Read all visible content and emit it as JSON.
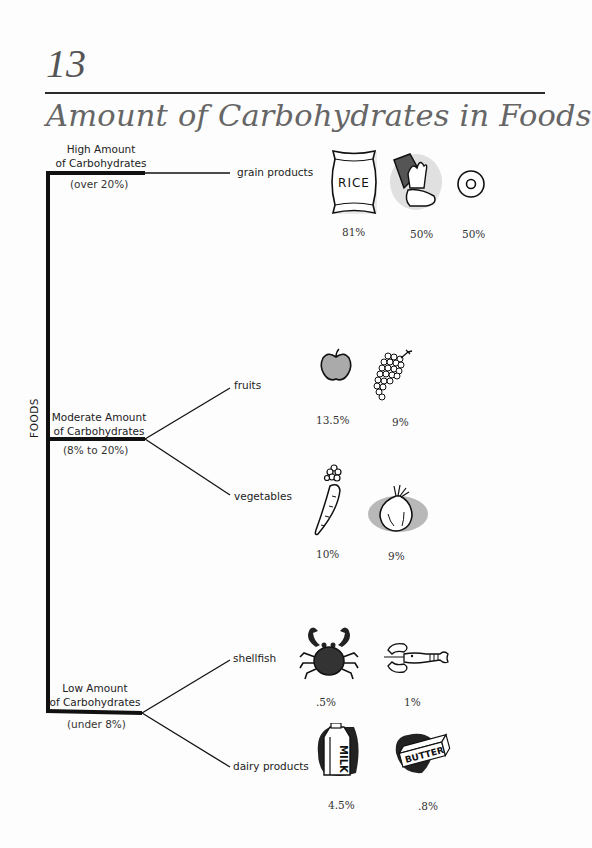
{
  "header": {
    "chapter_number": "13",
    "title": "Amount of Carbohydrates in Foods"
  },
  "root_label": "FOODS",
  "categories": [
    {
      "label_line1": "High Amount",
      "label_line2": "of Carbohydrates",
      "range": "(over 20%)",
      "branches": [
        {
          "label": "grain products",
          "items": [
            {
              "icon": "rice-bag-icon",
              "percent": "81%"
            },
            {
              "icon": "spilled-cereal-box-icon",
              "percent": "50%"
            },
            {
              "icon": "doughnut-icon",
              "percent": "50%"
            }
          ]
        }
      ]
    },
    {
      "label_line1": "Moderate Amount",
      "label_line2": "of Carbohydrates",
      "range": "(8% to 20%)",
      "branches": [
        {
          "label": "fruits",
          "items": [
            {
              "icon": "apple-icon",
              "percent": "13.5%"
            },
            {
              "icon": "grapes-icon",
              "percent": "9%"
            }
          ]
        },
        {
          "label": "vegetables",
          "items": [
            {
              "icon": "carrot-icon",
              "percent": "10%"
            },
            {
              "icon": "onion-icon",
              "percent": "9%"
            }
          ]
        }
      ]
    },
    {
      "label_line1": "Low Amount",
      "label_line2": "of Carbohydrates",
      "range": "(under 8%)",
      "branches": [
        {
          "label": "shellfish",
          "items": [
            {
              "icon": "crab-icon",
              "percent": ".5%"
            },
            {
              "icon": "lobster-icon",
              "percent": "1%"
            }
          ]
        },
        {
          "label": "dairy products",
          "items": [
            {
              "icon": "milk-carton-icon",
              "percent": "4.5%",
              "text": "MILK"
            },
            {
              "icon": "butter-stick-icon",
              "percent": ".8%",
              "text": "BUTTER"
            }
          ]
        }
      ]
    }
  ],
  "icon_text": {
    "rice": "RICE",
    "milk": "MILK",
    "butter": "BUTTER"
  },
  "colors": {
    "title": "#666666",
    "line": "#111111",
    "shade": "#bdbdbd"
  }
}
